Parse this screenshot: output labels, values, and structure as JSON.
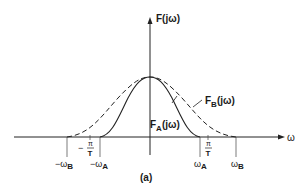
{
  "figure": {
    "caption": "(a)",
    "y_axis_label": "F(jω)",
    "x_axis_label": "ω",
    "curves": [
      {
        "name": "F_A(jω)",
        "label_main": "F",
        "label_sub": "A",
        "label_tail": "(jω)",
        "style": "solid",
        "support": [
          "-ωA",
          "ωA"
        ]
      },
      {
        "name": "F_B(jω)",
        "label_main": "F",
        "label_sub": "B",
        "label_tail": "(jω)",
        "style": "dashed",
        "support": [
          "-ωB",
          "ωB"
        ]
      }
    ],
    "ticks": {
      "neg_omega_b": {
        "pre": "−ω",
        "sub": "B"
      },
      "neg_omega_a": {
        "pre": "−ω",
        "sub": "A"
      },
      "omega_a": {
        "pre": "ω",
        "sub": "A"
      },
      "omega_b": {
        "pre": "ω",
        "sub": "B"
      },
      "neg_pi_over_t": {
        "sign": "−",
        "num": "π",
        "den": "T"
      },
      "pi_over_t": {
        "num": "π",
        "den": "T"
      }
    }
  }
}
